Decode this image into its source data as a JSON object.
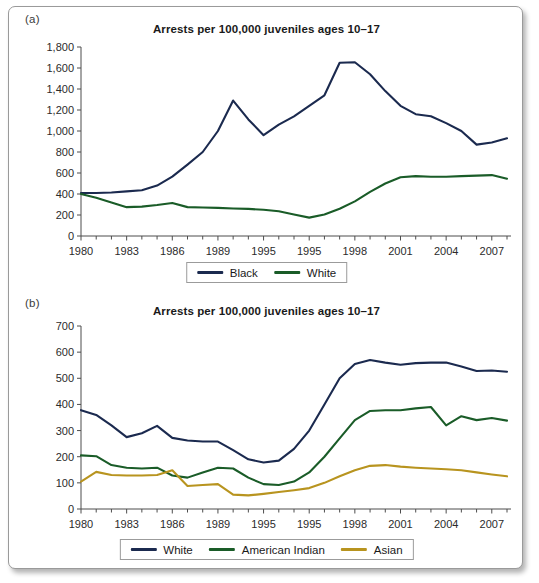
{
  "figure": {
    "panel_a_tag": "(a)",
    "panel_b_tag": "(b)"
  },
  "chart_data": [
    {
      "id": "panel-a",
      "type": "line",
      "title": "Arrests per 100,000 juveniles ages 10–17",
      "panel_label": "(a)",
      "xlabel": "",
      "ylabel": "",
      "grid": false,
      "legend_position": "bottom",
      "ylim": [
        0,
        1800
      ],
      "yticks": [
        0,
        200,
        400,
        600,
        800,
        1000,
        1200,
        1400,
        1600,
        1800
      ],
      "ytick_labels": [
        "0",
        "200",
        "400",
        "600",
        "800",
        "1,000",
        "1,200",
        "1,400",
        "1,600",
        "1,800"
      ],
      "x": [
        1980,
        1981,
        1982,
        1983,
        1984,
        1985,
        1986,
        1987,
        1988,
        1989,
        1990,
        1991,
        1992,
        1993,
        1994,
        1995,
        1996,
        1997,
        1998,
        1999,
        2000,
        2001,
        2002,
        2003,
        2004,
        2005,
        2006,
        2007,
        2008
      ],
      "xtick_labels": [
        "1980",
        "1983",
        "1986",
        "1989",
        "1995",
        "1995",
        "1998",
        "2001",
        "2004",
        "2007"
      ],
      "xtick_values": [
        1980,
        1983,
        1986,
        1989,
        1992,
        1995,
        1998,
        2001,
        2004,
        2007
      ],
      "minor_tick_values": [
        1981,
        1982,
        1984,
        1985,
        1987,
        1988,
        1990,
        1991,
        1993,
        1994,
        1996,
        1997,
        1999,
        2000,
        2002,
        2003,
        2005,
        2006,
        2008
      ],
      "series": [
        {
          "name": "Black",
          "color": "#1b2a4f",
          "values": [
            410,
            410,
            415,
            425,
            435,
            480,
            565,
            680,
            800,
            1000,
            1290,
            1110,
            960,
            1060,
            1140,
            1240,
            1340,
            1650,
            1655,
            1540,
            1380,
            1240,
            1160,
            1140,
            1075,
            1000,
            870,
            890,
            930
          ]
        },
        {
          "name": "White",
          "color": "#1a5c28",
          "values": [
            400,
            365,
            320,
            275,
            280,
            295,
            315,
            275,
            272,
            268,
            262,
            258,
            250,
            235,
            205,
            175,
            205,
            260,
            330,
            420,
            500,
            560,
            570,
            565,
            565,
            570,
            575,
            580,
            545
          ]
        }
      ],
      "series_extra": [
        {
          "name": "Black",
          "tail_values": [
            930,
            920,
            935,
            915,
            960,
            1040,
            1045,
            1045,
            925
          ]
        },
        {
          "name": "White",
          "tail_values": [
            545,
            540,
            535,
            530,
            525,
            520,
            515,
            510,
            540,
            535,
            520
          ]
        }
      ],
      "legend": [
        {
          "label": "Black",
          "color": "#1b2a4f"
        },
        {
          "label": "White",
          "color": "#1a5c28"
        }
      ]
    },
    {
      "id": "panel-b",
      "type": "line",
      "title": "Arrests per 100,000 juveniles ages 10–17",
      "panel_label": "(b)",
      "xlabel": "",
      "ylabel": "",
      "grid": false,
      "legend_position": "bottom",
      "ylim": [
        0,
        700
      ],
      "yticks": [
        0,
        100,
        200,
        300,
        400,
        500,
        600,
        700
      ],
      "ytick_labels": [
        "0",
        "100",
        "200",
        "300",
        "400",
        "500",
        "600",
        "700"
      ],
      "x": [
        1980,
        1981,
        1982,
        1983,
        1984,
        1985,
        1986,
        1987,
        1988,
        1989,
        1990,
        1991,
        1992,
        1993,
        1994,
        1995,
        1996,
        1997,
        1998,
        1999,
        2000,
        2001,
        2002,
        2003,
        2004,
        2005,
        2006,
        2007,
        2008
      ],
      "xtick_labels": [
        "1980",
        "1983",
        "1986",
        "1989",
        "1995",
        "1995",
        "1998",
        "2001",
        "2004",
        "2007"
      ],
      "xtick_values": [
        1980,
        1983,
        1986,
        1989,
        1992,
        1995,
        1998,
        2001,
        2004,
        2007
      ],
      "minor_tick_values": [
        1981,
        1982,
        1984,
        1985,
        1987,
        1988,
        1990,
        1991,
        1993,
        1994,
        1996,
        1997,
        1999,
        2000,
        2002,
        2003,
        2005,
        2006,
        2008
      ],
      "series": [
        {
          "name": "White",
          "color": "#1b2a4f",
          "values": [
            378,
            360,
            320,
            275,
            290,
            318,
            272,
            262,
            258,
            258,
            225,
            190,
            178,
            185,
            230,
            300,
            400,
            500,
            555,
            570,
            560,
            552,
            558,
            560,
            560,
            545,
            528,
            530,
            525
          ]
        },
        {
          "name": "American Indian",
          "color": "#1a5c28",
          "values": [
            205,
            202,
            168,
            158,
            155,
            158,
            128,
            120,
            140,
            158,
            155,
            120,
            95,
            92,
            105,
            140,
            200,
            270,
            340,
            375,
            378,
            378,
            385,
            390,
            320,
            355,
            340,
            348,
            338
          ]
        },
        {
          "name": "Asian",
          "color": "#b8941f",
          "values": [
            105,
            142,
            130,
            128,
            128,
            130,
            148,
            88,
            92,
            95,
            55,
            52,
            58,
            65,
            72,
            80,
            100,
            125,
            148,
            165,
            168,
            162,
            158,
            155,
            152,
            148,
            140,
            132,
            125
          ]
        }
      ],
      "series_extra": [
        {
          "name": "White",
          "tail_values": [
            525,
            520,
            518,
            500,
            498,
            505,
            512,
            520,
            498
          ]
        },
        {
          "name": "American Indian",
          "tail_values": [
            338,
            352,
            360,
            348,
            355,
            365,
            335,
            372,
            332
          ]
        },
        {
          "name": "Asian",
          "tail_values": [
            125,
            120,
            118,
            116,
            115,
            118,
            92,
            110
          ]
        }
      ],
      "legend": [
        {
          "label": "White",
          "color": "#1b2a4f"
        },
        {
          "label": "American Indian",
          "color": "#1a5c28"
        },
        {
          "label": "Asian",
          "color": "#b8941f"
        }
      ]
    }
  ]
}
